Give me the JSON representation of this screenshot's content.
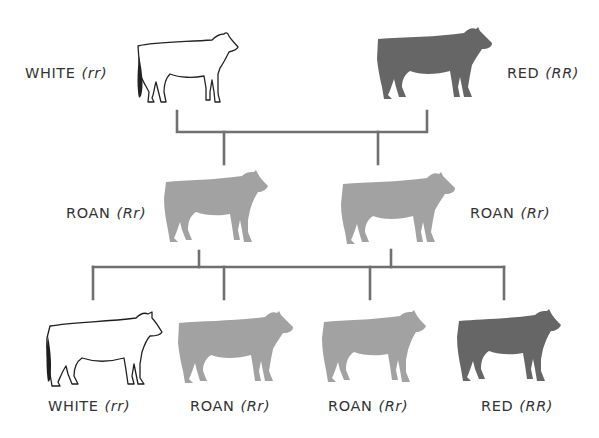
{
  "colors": {
    "red": "#666666",
    "roan": "#a2a2a2",
    "white_outline": "#222222",
    "lines": "#707070",
    "background": "#ffffff"
  },
  "parents": [
    {
      "phenotype": "WHITE",
      "genotype": "(rr)",
      "fill": "white"
    },
    {
      "phenotype": "RED",
      "genotype": "(RR)",
      "fill": "red"
    }
  ],
  "f1": [
    {
      "phenotype": "ROAN",
      "genotype": "(Rr)",
      "fill": "roan"
    },
    {
      "phenotype": "ROAN",
      "genotype": "(Rr)",
      "fill": "roan"
    }
  ],
  "f2": [
    {
      "phenotype": "WHITE",
      "genotype": "(rr)",
      "fill": "white"
    },
    {
      "phenotype": "ROAN",
      "genotype": "(Rr)",
      "fill": "roan"
    },
    {
      "phenotype": "ROAN",
      "genotype": "(Rr)",
      "fill": "roan"
    },
    {
      "phenotype": "RED",
      "genotype": "(RR)",
      "fill": "red"
    }
  ]
}
